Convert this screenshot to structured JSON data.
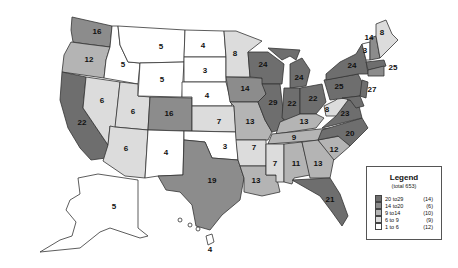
{
  "map": {
    "type": "choropleth",
    "region": "United States",
    "colors": {
      "20to29": "#6e6e6e",
      "14to20": "#8c8c8c",
      "9to14": "#b4b4b4",
      "6to9": "#dcdcdc",
      "1to6": "#ffffff"
    },
    "states": {
      "WA": "16",
      "OR": "12",
      "CA": "22",
      "ID": "5",
      "NV": "6",
      "UT": "6",
      "AZ": "6",
      "MT": "5",
      "WY": "5",
      "CO": "16",
      "NM": "4",
      "ND": "4",
      "SD": "3",
      "NE": "4",
      "KS": "7",
      "OK": "3",
      "TX": "19",
      "MN": "8",
      "IA": "14",
      "MO": "13",
      "AR": "7",
      "LA": "13",
      "WI": "24",
      "IL": "29",
      "MI": "24",
      "IN": "22",
      "OH": "22",
      "KY": "13",
      "TN": "9",
      "MS": "7",
      "AL": "11",
      "GA": "13",
      "FL": "21",
      "SC": "12",
      "NC": "20",
      "VA": "23",
      "WV": "8",
      "PA": "25",
      "NY": "24",
      "ME": "8",
      "NH": "14",
      "VT": "3",
      "MA": "25",
      "NJ": "27",
      "AK": "5",
      "HI": "4"
    }
  },
  "legend": {
    "title": "Legend",
    "subtitle": "(total 653)",
    "items": [
      {
        "range": "20 to29",
        "count": "(14)",
        "color": "#6e6e6e"
      },
      {
        "range": "14 to20",
        "count": "(6)",
        "color": "#8c8c8c"
      },
      {
        "range": "9 to14",
        "count": "(10)",
        "color": "#b4b4b4"
      },
      {
        "range": "6 to  9",
        "count": "(9)",
        "color": "#dcdcdc"
      },
      {
        "range": "1 to  6",
        "count": "(12)",
        "color": "#ffffff"
      }
    ]
  }
}
